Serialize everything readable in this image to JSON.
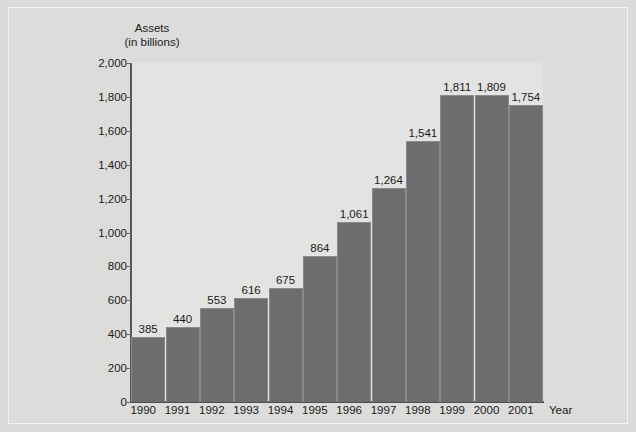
{
  "chart_data": {
    "type": "bar",
    "title": "",
    "xlabel": "Year",
    "ylabel": "Assets",
    "ylabel_line1": "Assets",
    "ylabel_line2": "(in billions)",
    "categories": [
      "1990",
      "1991",
      "1992",
      "1993",
      "1994",
      "1995",
      "1996",
      "1997",
      "1998",
      "1999",
      "2000",
      "2001"
    ],
    "values": [
      385,
      440,
      553,
      616,
      675,
      864,
      1061,
      1264,
      1541,
      1811,
      1809,
      1754
    ],
    "value_labels": [
      "385",
      "440",
      "553",
      "616",
      "675",
      "864",
      "1,061",
      "1,264",
      "1,541",
      "1,811",
      "1,809",
      "1,754"
    ],
    "ylim": [
      0,
      2000
    ],
    "ytick_values": [
      0,
      200,
      400,
      600,
      800,
      1000,
      1200,
      1400,
      1600,
      1800,
      2000
    ],
    "ytick_labels": [
      "0",
      "200",
      "400",
      "600",
      "800",
      "1,000",
      "1,200",
      "1,400",
      "1,600",
      "1,800",
      "2,000"
    ],
    "grid": false,
    "legend": null,
    "bar_color": "#6d6d6f",
    "plot_background": "#e3e3e1",
    "figure_background": "#dcdcda",
    "axis_color": "#58585a",
    "text_color": "#1b1b1b"
  }
}
